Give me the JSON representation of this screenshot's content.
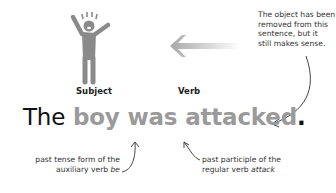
{
  "figure": {
    "subject_label": "Subject",
    "verb_label": "Verb",
    "object_note": [
      "The object has been",
      "removed from this",
      "sentence, but it",
      "still makes sense."
    ],
    "sentence": {
      "word_the": "The",
      "word_boy": "boy",
      "word_was": "was",
      "word_attacked": "attacked",
      "period": "."
    },
    "annotation_was": {
      "line1": "past tense form of the",
      "line2_prefix": "auxiliary verb ",
      "line2_italic": "be"
    },
    "annotation_attacked": {
      "line1": "past participle of the",
      "line2_prefix": "regular verb ",
      "line2_italic": "attack"
    },
    "colors": {
      "highlight_gray": "#9a9a9a",
      "text_dark": "#111111",
      "figure_gray": "#8a8a8a"
    },
    "icons": [
      "person-arms-raised-icon",
      "left-arrow-icon",
      "curved-arrow-icon"
    ]
  }
}
